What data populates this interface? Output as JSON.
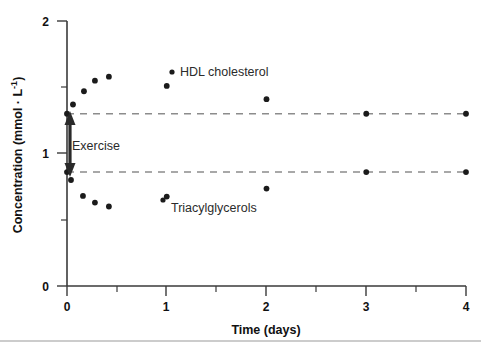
{
  "chart_data": {
    "type": "scatter",
    "title": "",
    "xlabel": "Time (days)",
    "ylabel": "Concentration (mmol · L",
    "ylabel_exponent": "-1",
    "ylabel_suffix": ")",
    "xlim": [
      0,
      4
    ],
    "ylim": [
      0,
      2
    ],
    "xticks": [
      0,
      1,
      2,
      3,
      4
    ],
    "xtick_labels": [
      "0",
      "1",
      "2",
      "3",
      "4"
    ],
    "xminor_ticks": [
      0.5,
      1.5,
      2.5,
      3.5
    ],
    "yticks": [
      0,
      1,
      2
    ],
    "ytick_labels": [
      "0",
      "1",
      "2"
    ],
    "yminor_ticks": [
      0.5,
      1.5
    ],
    "grid": false,
    "legend_position": "inline-annotation",
    "series": [
      {
        "name": "HDL cholesterol",
        "marker": "filled-circle",
        "color": "#1b1b1b",
        "points": [
          {
            "x": 0.0,
            "y": 1.3
          },
          {
            "x": 0.06,
            "y": 1.37
          },
          {
            "x": 0.17,
            "y": 1.47
          },
          {
            "x": 0.28,
            "y": 1.55
          },
          {
            "x": 0.42,
            "y": 1.58
          },
          {
            "x": 1.0,
            "y": 1.51
          },
          {
            "x": 2.0,
            "y": 1.41
          },
          {
            "x": 3.0,
            "y": 1.3
          },
          {
            "x": 4.0,
            "y": 1.3
          }
        ]
      },
      {
        "name": "Triacylglycerols",
        "marker": "filled-circle",
        "color": "#1b1b1b",
        "points": [
          {
            "x": 0.0,
            "y": 0.86
          },
          {
            "x": 0.04,
            "y": 0.8
          },
          {
            "x": 0.16,
            "y": 0.68
          },
          {
            "x": 0.28,
            "y": 0.63
          },
          {
            "x": 0.42,
            "y": 0.6
          },
          {
            "x": 1.0,
            "y": 0.675
          },
          {
            "x": 2.0,
            "y": 0.735
          },
          {
            "x": 3.0,
            "y": 0.86
          },
          {
            "x": 4.0,
            "y": 0.86
          }
        ]
      }
    ],
    "reference_lines": [
      {
        "name": "hdl-baseline",
        "y": 1.3,
        "style": "dashed",
        "color": "#8c8c8c"
      },
      {
        "name": "tag-baseline",
        "y": 0.86,
        "style": "dashed",
        "color": "#8c8c8c"
      }
    ],
    "annotations": [
      {
        "name": "hdl-series-label",
        "text": "HDL cholesterol",
        "x": 1.15,
        "y": 1.53
      },
      {
        "name": "tag-series-label",
        "text": "Triacylglycerols",
        "x": 1.05,
        "y": 0.64
      },
      {
        "name": "exercise-label",
        "text": "Exercise",
        "x": 0.03,
        "y": 1.06
      }
    ]
  },
  "axes": {
    "x_title": "Time (days)",
    "y_title_main": "Concentration (mmol · L",
    "y_title_exp": "-1",
    "y_title_close": ")"
  },
  "colors": {
    "marker": "#1b1b1b",
    "dashed": "#8c8c8c",
    "axis": "#3a3a3a",
    "text": "#111111",
    "rule": "#9a9a9a"
  }
}
